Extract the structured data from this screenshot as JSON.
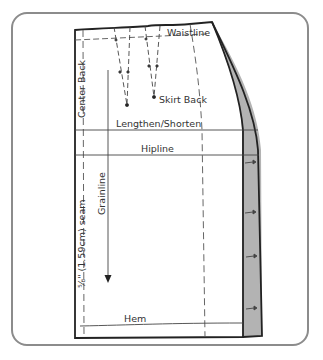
{
  "diagram": {
    "labels": {
      "waistline": "Waistline",
      "center_back": "Center Back",
      "skirt_back": "Skirt Back",
      "lengthen_shorten": "Lengthen/Shorten",
      "hipline": "Hipline",
      "grainline": "Grainline",
      "seam_allowance": "⅝\" (1.59cm) seam",
      "hem": "Hem"
    },
    "colors": {
      "frame": "#8c8c8c",
      "outline": "#222222",
      "dashed": "#555555",
      "added_width": "#b3b3b3"
    }
  }
}
